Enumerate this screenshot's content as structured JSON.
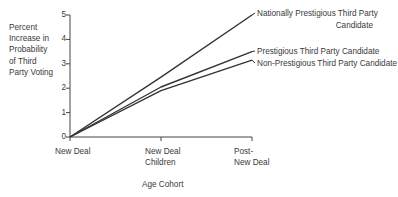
{
  "chart_data": {
    "type": "line",
    "title": "",
    "xlabel": "Age Cohort",
    "ylabel": "Percent Increase in Probability of Third Party Voting",
    "ylabel_lines": [
      "Percent",
      "Increase in",
      "Probability",
      "of Third",
      "Party Voting"
    ],
    "categories": [
      "New Deal",
      "New Deal Children",
      "Post-New Deal"
    ],
    "category_lines": [
      [
        "New Deal"
      ],
      [
        "New Deal",
        "Children"
      ],
      [
        "Post-",
        "New Deal"
      ]
    ],
    "yticks": [
      "0",
      "1",
      "2",
      "3",
      "4",
      "5"
    ],
    "ylim": [
      0,
      5
    ],
    "grid": false,
    "legend_position": "inline-right",
    "series": [
      {
        "name": "Nationally Prestigious Third Party Candidate",
        "label_lines": [
          "Nationally Prestigious Third Party",
          "Candidate"
        ],
        "values": [
          0,
          2.45,
          5.0
        ]
      },
      {
        "name": "Prestigious Third Party Candidate",
        "label_lines": [
          "Prestigious Third Party Candidate"
        ],
        "values": [
          0,
          2.05,
          3.5
        ]
      },
      {
        "name": "Non-Prestigious Third Party Candidate",
        "label_lines": [
          "Non-Prestigious Third Party Candidate"
        ],
        "values": [
          0,
          1.9,
          3.15
        ]
      }
    ],
    "line_color": "#333333"
  }
}
